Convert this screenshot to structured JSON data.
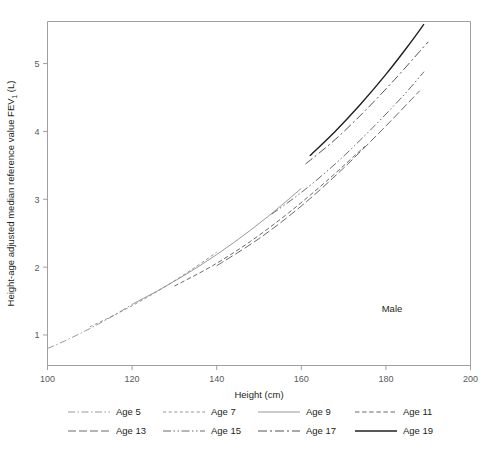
{
  "figure": {
    "annotation": "Male",
    "annotation_x": 392,
    "annotation_y": 312
  },
  "chart_data": {
    "type": "line",
    "title": "",
    "xlabel": "Height (cm)",
    "ylabel_full": "Height-age adjusted median reference value FEV₁ (L)",
    "ylabel_part1": "Height-age adjusted median reference value FEV",
    "ylabel_sub": "1",
    "ylabel_part2": " (L)",
    "xlim": [
      100,
      200
    ],
    "ylim": [
      0.55,
      5.62
    ],
    "xticks": [
      100,
      120,
      140,
      160,
      180,
      200
    ],
    "xtick_labels": [
      "100",
      "120",
      "140",
      "160",
      "180",
      "200"
    ],
    "yticks": [
      1,
      2,
      3,
      4,
      5
    ],
    "ytick_labels": [
      "1",
      "2",
      "3",
      "4",
      "5"
    ],
    "grid": false,
    "legend_position": "below",
    "annotations": [
      "Male"
    ],
    "series": [
      {
        "name": "Age 5",
        "label": "Age 5",
        "dash": "7,2.5,1.5,2.5",
        "width": 0.9,
        "color": "#8a8c8e",
        "x": [
          100,
          104,
          108,
          112,
          116,
          120
        ],
        "y": [
          0.8,
          0.91,
          1.03,
          1.16,
          1.3,
          1.45
        ]
      },
      {
        "name": "Age 7",
        "label": "Age 7",
        "dash": "3.2,2.4",
        "width": 0.9,
        "color": "#8a8c8e",
        "x": [
          110,
          116,
          122,
          128,
          134,
          140
        ],
        "y": [
          1.12,
          1.3,
          1.5,
          1.72,
          1.96,
          2.22
        ]
      },
      {
        "name": "Age 9",
        "label": "Age 9",
        "dash": "0",
        "width": 0.9,
        "color": "#8a8c8e",
        "x": [
          120,
          128,
          136,
          144,
          152,
          160
        ],
        "y": [
          1.45,
          1.72,
          2.02,
          2.36,
          2.74,
          3.16
        ]
      },
      {
        "name": "Age 11",
        "label": "Age 11",
        "dash": "4.5,2.6",
        "width": 0.9,
        "color": "#58595b",
        "x": [
          130,
          139,
          148,
          157,
          166,
          175
        ],
        "y": [
          1.72,
          2.02,
          2.38,
          2.8,
          3.27,
          3.78
        ]
      },
      {
        "name": "Age 13",
        "label": "Age 13",
        "dash": "8,3",
        "width": 0.9,
        "color": "#58595b",
        "x": [
          140,
          150,
          160,
          170,
          180,
          188
        ],
        "y": [
          2.02,
          2.42,
          2.9,
          3.46,
          4.08,
          4.6
        ]
      },
      {
        "name": "Age 15",
        "label": "Age 15",
        "dash": "8,2.5,1.5,2.5,1.5,2.5",
        "width": 0.9,
        "color": "#58595b",
        "x": [
          153,
          160,
          168,
          176,
          184,
          189
        ],
        "y": [
          2.78,
          3.1,
          3.52,
          4.0,
          4.52,
          4.88
        ]
      },
      {
        "name": "Age 17",
        "label": "Age 17",
        "dash": "9,3,2,3",
        "width": 0.9,
        "color": "#414042",
        "x": [
          161,
          168,
          175,
          182,
          188,
          190
        ],
        "y": [
          3.52,
          3.88,
          4.3,
          4.76,
          5.18,
          5.32
        ]
      },
      {
        "name": "Age 19",
        "label": "Age 19",
        "dash": "0",
        "width": 1.4,
        "color": "#231f20",
        "x": [
          162,
          168,
          174,
          180,
          185,
          189
        ],
        "y": [
          3.64,
          4.0,
          4.4,
          4.84,
          5.24,
          5.58
        ]
      }
    ]
  },
  "legend": {
    "rows": [
      [
        {
          "label": "Age 5",
          "series_index": 0
        },
        {
          "label": "Age 7",
          "series_index": 1
        },
        {
          "label": "Age 9",
          "series_index": 2
        },
        {
          "label": "Age 11",
          "series_index": 3
        }
      ],
      [
        {
          "label": "Age 13",
          "series_index": 4
        },
        {
          "label": "Age 15",
          "series_index": 5
        },
        {
          "label": "Age 17",
          "series_index": 6
        },
        {
          "label": "Age 19",
          "series_index": 7
        }
      ]
    ]
  },
  "style": {
    "axis_color": "#939598",
    "text_color": "#231f20",
    "tick_text_color": "#58595b",
    "background": "#ffffff"
  }
}
